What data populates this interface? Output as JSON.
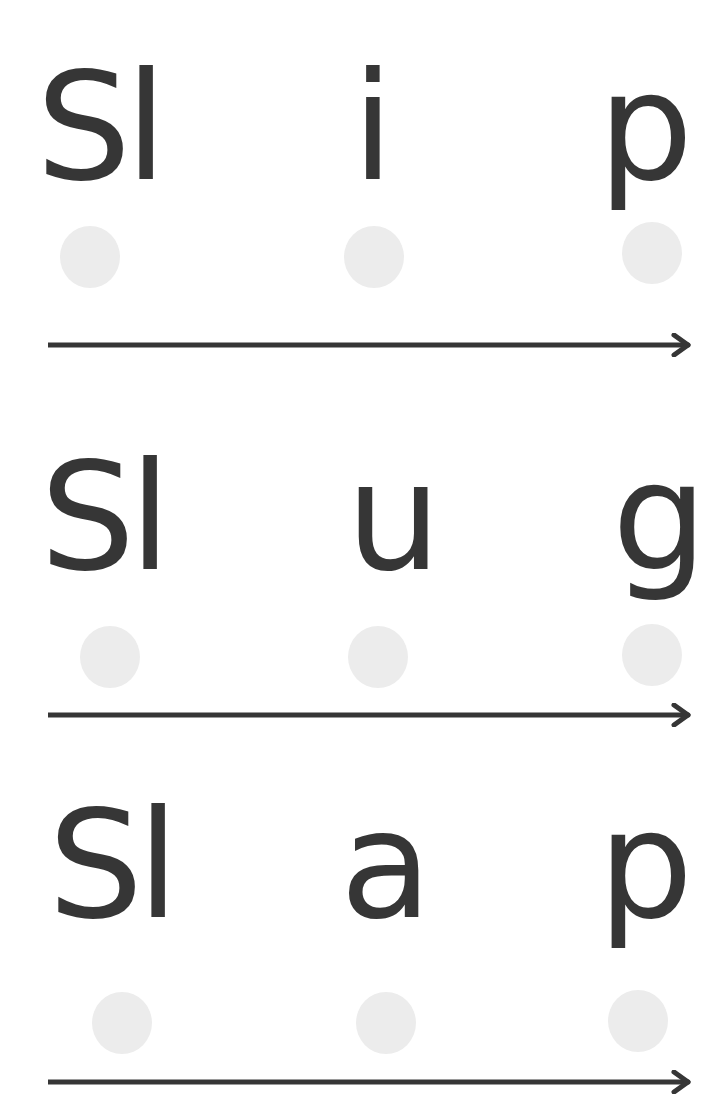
{
  "worksheet": {
    "rows": [
      {
        "word": "Slip",
        "segments": [
          "Sl",
          "i",
          "p"
        ],
        "dots": 3,
        "arrow": "right-arrow"
      },
      {
        "word": "Slug",
        "segments": [
          "Sl",
          "u",
          "g"
        ],
        "dots": 3,
        "arrow": "right-arrow"
      },
      {
        "word": "Slap",
        "segments": [
          "Sl",
          "a",
          "p"
        ],
        "dots": 3,
        "arrow": "right-arrow"
      }
    ]
  },
  "colors": {
    "text": "#363636",
    "dot": "#ececec",
    "background": "#ffffff"
  }
}
